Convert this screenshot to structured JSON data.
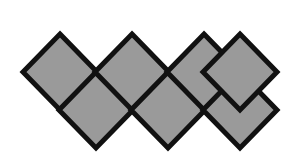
{
  "figure": {
    "title": "Diamond strip net",
    "domain_label": "geometry-figure",
    "canvas": {
      "width": 294,
      "height": 157,
      "background_color": "#ffffff"
    },
    "style": {
      "fill_color": "#9a9a9a",
      "stroke_color": "#111111",
      "stroke_width": 5,
      "stroke_linejoin": "miter",
      "shape_count": 7,
      "shape_kind": "diamond"
    },
    "geometry": {
      "half_width": 37,
      "half_height": 38,
      "upper_row_center_y": 72,
      "lower_row_center_y": 110,
      "horizontal_step": 36,
      "first_center_x": 60
    },
    "shapes": [
      {
        "id": "diamond-1",
        "row": "upper",
        "cx": 60,
        "cy": 72,
        "order": 1
      },
      {
        "id": "diamond-2",
        "row": "lower",
        "cx": 96,
        "cy": 110,
        "order": 2
      },
      {
        "id": "diamond-3",
        "row": "upper",
        "cx": 132,
        "cy": 72,
        "order": 3
      },
      {
        "id": "diamond-4",
        "row": "lower",
        "cx": 168,
        "cy": 110,
        "order": 4
      },
      {
        "id": "diamond-5",
        "row": "upper",
        "cx": 204,
        "cy": 72,
        "order": 5
      },
      {
        "id": "diamond-6",
        "row": "lower",
        "cx": 240,
        "cy": 110,
        "order": 6
      },
      {
        "id": "diamond-7",
        "row": "upper",
        "cx": 240,
        "cy": 72,
        "order": 7
      }
    ],
    "key_vertices": {
      "leftmost_point": [
        23,
        72
      ],
      "rightmost_point": [
        277,
        110
      ],
      "top_apexes": [
        [
          60,
          34
        ],
        [
          132,
          34
        ],
        [
          204,
          34
        ]
      ],
      "bottom_apexes": [
        [
          96,
          148
        ],
        [
          168,
          148
        ],
        [
          240,
          148
        ]
      ],
      "crossing_points": [
        [
          96,
          72
        ],
        [
          132,
          110
        ],
        [
          168,
          72
        ],
        [
          204,
          110
        ]
      ]
    }
  }
}
